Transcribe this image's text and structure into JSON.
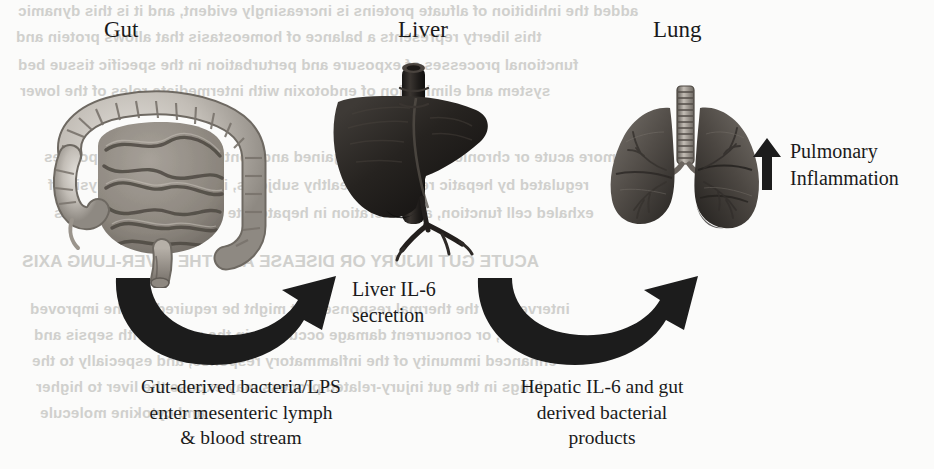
{
  "figure": {
    "background_color": "#fbfbfa",
    "ink_color": "#1a1a1a",
    "arrow_color": "#1c1c1c"
  },
  "organs": [
    {
      "key": "gut",
      "label": "Gut",
      "icon": "gut-intestine-illustration",
      "label_x": 104,
      "label_y": 18,
      "art_x": 40,
      "art_y": 58,
      "art_w": 250,
      "art_h": 230
    },
    {
      "key": "liver",
      "label": "Liver",
      "icon": "liver-illustration",
      "label_x": 398,
      "label_y": 18,
      "art_x": 330,
      "art_y": 58,
      "art_w": 215,
      "art_h": 215
    },
    {
      "key": "lung",
      "label": "Lung",
      "icon": "lungs-illustration",
      "label_x": 653,
      "label_y": 18,
      "art_x": 596,
      "art_y": 78,
      "art_w": 180,
      "art_h": 165
    }
  ],
  "arrows": [
    {
      "key": "gut-to-liver",
      "icon": "curved-arrow-right-icon",
      "x": 108,
      "y": 272,
      "w": 248,
      "h": 102,
      "direction": "left-to-right"
    },
    {
      "key": "liver-to-lung",
      "icon": "curved-arrow-right-icon",
      "x": 470,
      "y": 272,
      "w": 248,
      "h": 102,
      "direction": "left-to-right"
    }
  ],
  "up_arrow": {
    "icon": "arrow-up-icon",
    "x": 752,
    "y": 138,
    "w": 30,
    "h": 52
  },
  "annotations": {
    "liver_secretion": {
      "x": 352,
      "y": 276,
      "lines": [
        "Liver IL-6",
        "secretion"
      ]
    },
    "pulmonary": {
      "x": 790,
      "y": 138,
      "lines": [
        "Pulmonary",
        "Inflammation"
      ]
    }
  },
  "captions": [
    {
      "key": "gut-caption",
      "x": 76,
      "y": 374,
      "w": 330,
      "lines": [
        "Gut-derived bacteria/LPS",
        "enter mesenteric lymph",
        "& blood stream"
      ]
    },
    {
      "key": "liver-caption",
      "x": 452,
      "y": 374,
      "w": 300,
      "lines": [
        "Hepatic IL-6 and gut",
        "derived bacterial",
        "products"
      ]
    }
  ],
  "bleed_through": [
    {
      "x": 18,
      "y": 2,
      "size": 15,
      "text": "added the inhibition of alfuate proteins is increasingly evident, and it is this dynamic"
    },
    {
      "x": 16,
      "y": 28,
      "size": 15,
      "text": "this liberty represents a balance of homeostasis that allows protein and"
    },
    {
      "x": 18,
      "y": 56,
      "size": 15,
      "text": "functional processes of exposure and perturbation in the specific tissue bed"
    },
    {
      "x": 20,
      "y": 82,
      "size": 15,
      "text": "system and elimination of endotoxin with intermediate roles of the lower"
    },
    {
      "x": 44,
      "y": 148,
      "size": 15,
      "text": "more acute or chronic insults can be gained and contribute to their responses"
    },
    {
      "x": 48,
      "y": 176,
      "size": 15,
      "text": "regulated by hepatic reserve in healthy subjects, including the analysis of"
    },
    {
      "x": 54,
      "y": 204,
      "size": 15,
      "text": "exhaled cell function, and alteration in hepatocyte signalling mechanisms"
    },
    {
      "x": 22,
      "y": 252,
      "size": 17,
      "text": "ACUTE GUT INJURY OR DISEASE AND THE LIVER-LUNG AXIS"
    },
    {
      "x": 30,
      "y": 300,
      "size": 15,
      "text": "intervene in the thermal response that might be required for the improved"
    },
    {
      "x": 34,
      "y": 326,
      "size": 15,
      "text": "sepsis, or concurrent damage occurring in the patient with sepsis and"
    },
    {
      "x": 32,
      "y": 352,
      "size": 15,
      "text": "enhanced immunity of the inflammatory response, and especially to the"
    },
    {
      "x": 36,
      "y": 378,
      "size": 15,
      "text": "lungs in the gut injury-related process may expose the liver to higher"
    },
    {
      "x": 40,
      "y": 404,
      "size": 15,
      "text": "and cytokine molecule"
    }
  ]
}
